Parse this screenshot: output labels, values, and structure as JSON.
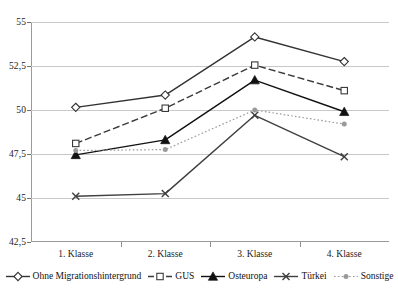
{
  "chart_data": {
    "type": "line",
    "title": "",
    "xlabel": "",
    "ylabel": "",
    "categories": [
      "1. Klasse",
      "2. Klasse",
      "3. Klasse",
      "4. Klasse"
    ],
    "ylim": [
      42.5,
      55
    ],
    "yticks": [
      42.5,
      45,
      47.5,
      50,
      52.5,
      55
    ],
    "ytick_labels": [
      "42,5",
      "45",
      "47,5",
      "50",
      "52,5",
      "55"
    ],
    "grid": true,
    "legend_position": "bottom",
    "series": [
      {
        "name": "Ohne Migrationshintergrund",
        "values": [
          50.15,
          50.85,
          54.15,
          52.75
        ],
        "marker": "diamond",
        "line_style": "solid",
        "color": "#333333"
      },
      {
        "name": "GUS",
        "values": [
          48.1,
          50.1,
          52.55,
          51.1
        ],
        "marker": "open-square",
        "line_style": "dashed",
        "color": "#3a3a3a"
      },
      {
        "name": "Osteuropa",
        "values": [
          47.45,
          48.3,
          51.7,
          49.9
        ],
        "marker": "filled-triangle",
        "line_style": "solid",
        "color": "#111111"
      },
      {
        "name": "Türkei",
        "values": [
          45.1,
          45.25,
          49.7,
          47.35
        ],
        "marker": "cross",
        "line_style": "solid",
        "color": "#3f3f3f"
      },
      {
        "name": "Sonstige",
        "values": [
          47.7,
          47.75,
          50.0,
          49.2
        ],
        "marker": "dot",
        "line_style": "dotted",
        "color": "#9a9a9a"
      }
    ]
  },
  "legend": {
    "items": [
      {
        "label": "Ohne Migrationshintergrund"
      },
      {
        "label": "GUS"
      },
      {
        "label": "Osteuropa"
      },
      {
        "label": "Türkei"
      },
      {
        "label": "Sonstige"
      }
    ]
  },
  "axes": {
    "y": {
      "labels": [
        "55",
        "52,5",
        "50",
        "47,5",
        "45",
        "42,5"
      ]
    },
    "x": {
      "labels": [
        "1. Klasse",
        "2. Klasse",
        "3. Klasse",
        "4. Klasse"
      ]
    }
  }
}
